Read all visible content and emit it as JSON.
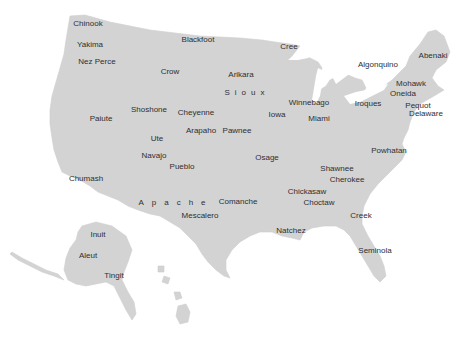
{
  "map": {
    "title": "Native American Tribes of the United States",
    "land_color": "#d3d3d3",
    "text_color": "#2f2f2f",
    "labels": [
      {
        "name": "Chinook",
        "x": 88,
        "y": 24
      },
      {
        "name": "Yakima",
        "x": 90,
        "y": 45
      },
      {
        "name": "Nez Perce",
        "x": 97,
        "y": 62
      },
      {
        "name": "Blackfoot",
        "x": 198,
        "y": 40
      },
      {
        "name": "Cree",
        "x": 289,
        "y": 47
      },
      {
        "name": "Crow",
        "x": 170,
        "y": 72
      },
      {
        "name": "Arikara",
        "x": 241,
        "y": 75
      },
      {
        "name": "Sioux",
        "x": 247,
        "y": 93
      },
      {
        "name": "Algonquino",
        "x": 378,
        "y": 65
      },
      {
        "name": "Abenaki",
        "x": 433,
        "y": 56
      },
      {
        "name": "Mohawk",
        "x": 411,
        "y": 84
      },
      {
        "name": "Oneida",
        "x": 403,
        "y": 94
      },
      {
        "name": "Iroques",
        "x": 368,
        "y": 104
      },
      {
        "name": "Pequot",
        "x": 418,
        "y": 106
      },
      {
        "name": "Delaware",
        "x": 426,
        "y": 114
      },
      {
        "name": "Shoshone",
        "x": 149,
        "y": 110
      },
      {
        "name": "Cheyenne",
        "x": 196,
        "y": 113
      },
      {
        "name": "Paiute",
        "x": 101,
        "y": 119
      },
      {
        "name": "Iowa",
        "x": 277,
        "y": 115
      },
      {
        "name": "Winnebago",
        "x": 309,
        "y": 103
      },
      {
        "name": "Miami",
        "x": 319,
        "y": 119
      },
      {
        "name": "Arapaho",
        "x": 201,
        "y": 131
      },
      {
        "name": "Pawnee",
        "x": 237,
        "y": 131
      },
      {
        "name": "Ute",
        "x": 157,
        "y": 139
      },
      {
        "name": "Navajo",
        "x": 154,
        "y": 156
      },
      {
        "name": "Pueblo",
        "x": 182,
        "y": 167
      },
      {
        "name": "Osage",
        "x": 267,
        "y": 158
      },
      {
        "name": "Powhatan",
        "x": 389,
        "y": 151
      },
      {
        "name": "Shawnee",
        "x": 337,
        "y": 169
      },
      {
        "name": "Cherokee",
        "x": 347,
        "y": 180
      },
      {
        "name": "Chumash",
        "x": 86,
        "y": 179
      },
      {
        "name": "Chickasaw",
        "x": 307,
        "y": 192
      },
      {
        "name": "Choctaw",
        "x": 319,
        "y": 203
      },
      {
        "name": "Apache",
        "x": 176,
        "y": 203
      },
      {
        "name": "Comanche",
        "x": 238,
        "y": 202
      },
      {
        "name": "Mescalero",
        "x": 200,
        "y": 216
      },
      {
        "name": "Creek",
        "x": 361,
        "y": 216
      },
      {
        "name": "Natchez",
        "x": 291,
        "y": 231
      },
      {
        "name": "Seminola",
        "x": 375,
        "y": 251
      },
      {
        "name": "Inuit",
        "x": 98,
        "y": 235
      },
      {
        "name": "Aleut",
        "x": 88,
        "y": 256
      },
      {
        "name": "Tingit",
        "x": 114,
        "y": 276
      }
    ]
  }
}
